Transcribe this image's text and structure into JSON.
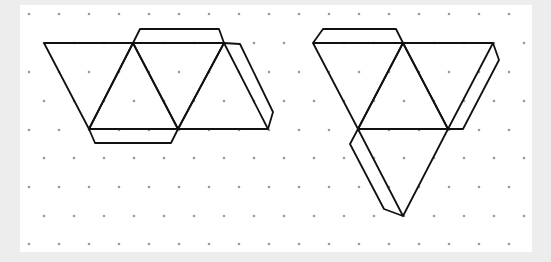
{
  "diagram": {
    "colors": {
      "background": "#ededed",
      "paper": "#ffffff",
      "dot": "#9a9a9a",
      "line": "#111111"
    },
    "grid": {
      "type": "isometric-dots",
      "row_y": [
        14,
        43,
        72,
        101,
        130,
        158,
        187,
        216,
        244
      ],
      "even_row_x_start": 29,
      "odd_row_x_start": 44,
      "spacing_x": 30,
      "x_max": 530
    },
    "figures": [
      {
        "name": "net-left",
        "faces": [
          [
            [
              44,
              43
            ],
            [
              133,
              43
            ],
            [
              89,
              129
            ]
          ],
          [
            [
              133,
              43
            ],
            [
              89,
              129
            ],
            [
              178,
              129
            ]
          ],
          [
            [
              133,
              43
            ],
            [
              224,
              43
            ],
            [
              178,
              129
            ]
          ],
          [
            [
              224,
              43
            ],
            [
              178,
              129
            ],
            [
              268,
              129
            ]
          ]
        ],
        "tabs": [
          [
            [
              133,
              43
            ],
            [
              140,
              29
            ],
            [
              219,
              29
            ],
            [
              224,
              43
            ]
          ],
          [
            [
              224,
              43
            ],
            [
              240,
              44
            ],
            [
              273,
              112
            ],
            [
              268,
              129
            ]
          ],
          [
            [
              89,
              129
            ],
            [
              95,
              143
            ],
            [
              171,
              143
            ],
            [
              178,
              129
            ]
          ]
        ]
      },
      {
        "name": "net-right",
        "faces": [
          [
            [
              313,
              43
            ],
            [
              403,
              43
            ],
            [
              358,
              129
            ]
          ],
          [
            [
              403,
              43
            ],
            [
              358,
              129
            ],
            [
              448,
              129
            ]
          ],
          [
            [
              403,
              43
            ],
            [
              493,
              43
            ],
            [
              448,
              129
            ]
          ],
          [
            [
              358,
              129
            ],
            [
              448,
              129
            ],
            [
              403,
              216
            ]
          ]
        ],
        "tabs": [
          [
            [
              313,
              43
            ],
            [
              323,
              29
            ],
            [
              396,
              29
            ],
            [
              403,
              43
            ]
          ],
          [
            [
              493,
              43
            ],
            [
              499,
              60
            ],
            [
              463,
              129
            ],
            [
              448,
              129
            ]
          ],
          [
            [
              358,
              129
            ],
            [
              350,
              144
            ],
            [
              384,
              209
            ],
            [
              403,
              216
            ]
          ]
        ]
      }
    ]
  }
}
